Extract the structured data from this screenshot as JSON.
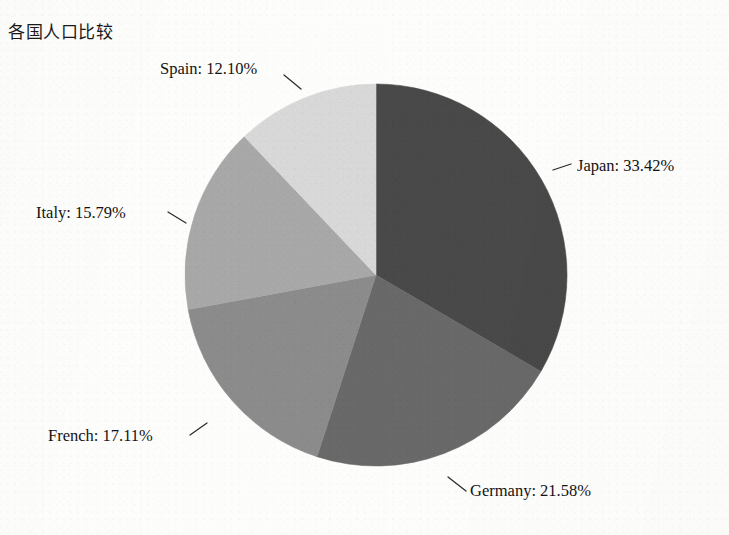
{
  "chart_title": "各国人口比较",
  "background_color": "#fdfdfc",
  "labels": {
    "japan": "Japan: 33.42%",
    "germany": "Germany: 21.58%",
    "french": "French: 17.11%",
    "italy": "Italy: 15.79%",
    "spain": "Spain: 12.10%"
  },
  "caption": "",
  "chart_data": {
    "type": "pie",
    "title": "各国人口比较",
    "xlabel": "",
    "ylabel": "",
    "unit": "%",
    "start_angle_deg": 90,
    "direction": "clockwise",
    "legend": "none",
    "labels_position": "outside-with-leader-lines",
    "total": 100.0,
    "categories": [
      "Japan",
      "Germany",
      "French",
      "Italy",
      "Spain"
    ],
    "values": [
      33.42,
      21.58,
      17.11,
      15.79,
      12.1
    ],
    "colors": [
      "#4a4a4a",
      "#6b6b6b",
      "#8e8e8e",
      "#ababab",
      "#dcdcdc"
    ],
    "slices": [
      {
        "name": "Japan",
        "value": 33.42,
        "label": "Japan: 33.42%",
        "color": "#4a4a4a"
      },
      {
        "name": "Germany",
        "value": 21.58,
        "label": "Germany: 21.58%",
        "color": "#6b6b6b"
      },
      {
        "name": "French",
        "value": 17.11,
        "label": "French: 17.11%",
        "color": "#8e8e8e"
      },
      {
        "name": "Italy",
        "value": 15.79,
        "label": "Italy: 15.79%",
        "color": "#ababab"
      },
      {
        "name": "Spain",
        "value": 12.1,
        "label": "Spain: 12.10%",
        "color": "#dcdcdc"
      }
    ]
  }
}
